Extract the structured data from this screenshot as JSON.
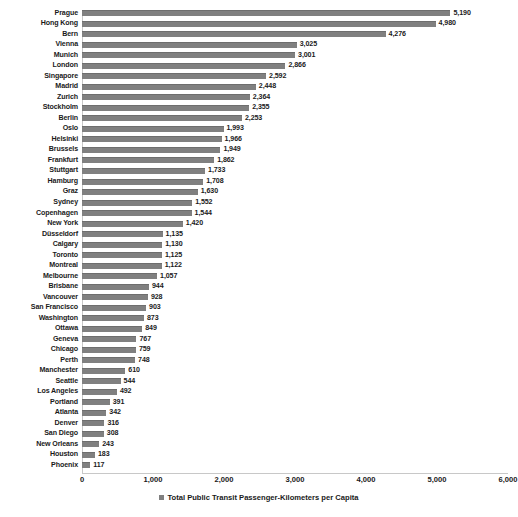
{
  "chart_data": {
    "type": "bar",
    "orientation": "horizontal",
    "title": "",
    "xlabel": "",
    "ylabel": "",
    "xlim": [
      0,
      6000
    ],
    "xticks": [
      0,
      1000,
      2000,
      3000,
      4000,
      5000,
      6000
    ],
    "xtick_labels": [
      "0",
      "1,000",
      "2,000",
      "3,000",
      "4,000",
      "5,000",
      "6,000"
    ],
    "grid": false,
    "legend_position": "bottom",
    "legend": [
      "Total Public Transit Passenger-Kilometers per Capita"
    ],
    "series_name": "Total Public Transit Passenger-Kilometers per Capita",
    "bar_color": "#808080",
    "categories": [
      "Prague",
      "Hong Kong",
      "Bern",
      "Vienna",
      "Munich",
      "London",
      "Singapore",
      "Madrid",
      "Zurich",
      "Stockholm",
      "Berlin",
      "Oslo",
      "Helsinki",
      "Brussels",
      "Frankfurt",
      "Stuttgart",
      "Hamburg",
      "Graz",
      "Sydney",
      "Copenhagen",
      "New York",
      "Düsseldorf",
      "Calgary",
      "Toronto",
      "Montreal",
      "Melbourne",
      "Brisbane",
      "Vancouver",
      "San Francisco",
      "Washington",
      "Ottawa",
      "Geneva",
      "Chicago",
      "Perth",
      "Manchester",
      "Seattle",
      "Los Angeles",
      "Portland",
      "Atlanta",
      "Denver",
      "San Diego",
      "New Orleans",
      "Houston",
      "Phoenix"
    ],
    "values": [
      5190,
      4980,
      4276,
      3025,
      3001,
      2866,
      2592,
      2448,
      2364,
      2355,
      2253,
      1993,
      1966,
      1949,
      1862,
      1733,
      1708,
      1630,
      1552,
      1544,
      1420,
      1135,
      1130,
      1125,
      1122,
      1057,
      944,
      928,
      903,
      873,
      849,
      767,
      759,
      748,
      610,
      544,
      492,
      391,
      342,
      316,
      308,
      243,
      183,
      117
    ],
    "value_labels": [
      "5,190",
      "4,980",
      "4,276",
      "3,025",
      "3,001",
      "2,866",
      "2,592",
      "2,448",
      "2,364",
      "2,355",
      "2,253",
      "1,993",
      "1,966",
      "1,949",
      "1,862",
      "1,733",
      "1,708",
      "1,630",
      "1,552",
      "1,544",
      "1,420",
      "1,135",
      "1,130",
      "1,125",
      "1,122",
      "1,057",
      "944",
      "928",
      "903",
      "873",
      "849",
      "767",
      "759",
      "748",
      "610",
      "544",
      "492",
      "391",
      "342",
      "316",
      "308",
      "243",
      "183",
      "117"
    ]
  }
}
